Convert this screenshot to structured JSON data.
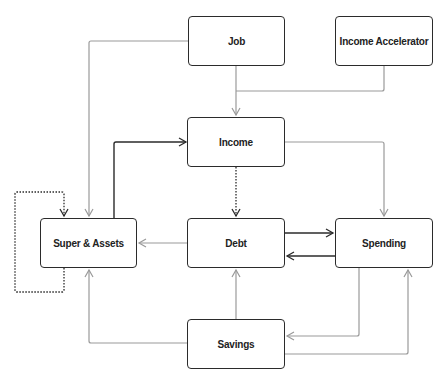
{
  "diagram": {
    "type": "flowchart",
    "nodes": [
      {
        "id": "job",
        "label": "Job"
      },
      {
        "id": "income_accelerator",
        "label": "Income Accelerator"
      },
      {
        "id": "income",
        "label": "Income"
      },
      {
        "id": "super_assets",
        "label": "Super & Assets"
      },
      {
        "id": "debt",
        "label": "Debt"
      },
      {
        "id": "spending",
        "label": "Spending"
      },
      {
        "id": "savings",
        "label": "Savings"
      }
    ],
    "edges": [
      {
        "from": "job",
        "to": "income",
        "style": "solid-grey"
      },
      {
        "from": "income_accelerator",
        "to": "income",
        "style": "solid-grey"
      },
      {
        "from": "job",
        "to": "super_assets",
        "style": "solid-grey"
      },
      {
        "from": "super_assets",
        "to": "income",
        "style": "solid-dark"
      },
      {
        "from": "income",
        "to": "debt",
        "style": "dotted-dark"
      },
      {
        "from": "income",
        "to": "spending",
        "style": "solid-grey"
      },
      {
        "from": "super_assets",
        "to": "super_assets",
        "style": "dotted-dark"
      },
      {
        "from": "debt",
        "to": "super_assets",
        "style": "solid-grey"
      },
      {
        "from": "debt",
        "to": "spending",
        "style": "solid-dark"
      },
      {
        "from": "spending",
        "to": "debt",
        "style": "solid-dark"
      },
      {
        "from": "savings",
        "to": "debt",
        "style": "solid-grey"
      },
      {
        "from": "savings",
        "to": "super_assets",
        "style": "solid-grey"
      },
      {
        "from": "spending",
        "to": "savings",
        "style": "solid-grey"
      },
      {
        "from": "savings",
        "to": "spending",
        "style": "solid-grey"
      }
    ],
    "colors": {
      "dark": "#2b2b2b",
      "grey": "#9a9a9a",
      "node_fill": "#ffffff"
    }
  }
}
